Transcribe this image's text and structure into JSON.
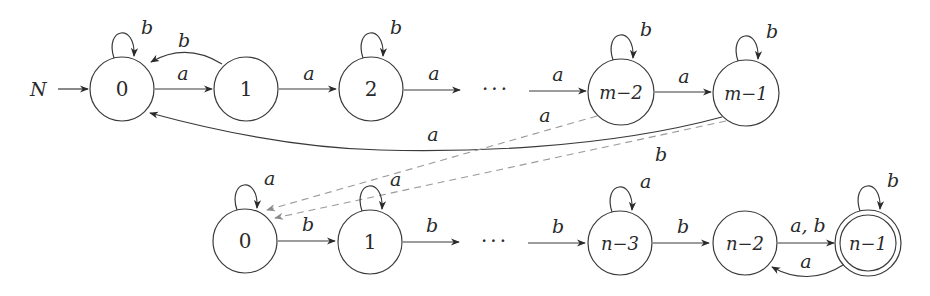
{
  "diagram": {
    "type": "finite-automaton",
    "start_label": "N",
    "ellipsis": "···",
    "top_row": {
      "states": [
        {
          "id": "t0",
          "label": "0",
          "self_loop": "b"
        },
        {
          "id": "t1",
          "label": "1"
        },
        {
          "id": "t2",
          "label": "2",
          "self_loop": "b"
        },
        {
          "id": "tm2",
          "label": "m−2",
          "self_loop": "b"
        },
        {
          "id": "tm1",
          "label": "m−1",
          "self_loop": "b"
        }
      ],
      "edges": [
        {
          "from": "t0",
          "to": "t1",
          "label": "a"
        },
        {
          "from": "t1",
          "to": "t0",
          "label": "b"
        },
        {
          "from": "t1",
          "to": "t2",
          "label": "a"
        },
        {
          "from": "t2",
          "to": "…",
          "label": "a"
        },
        {
          "from": "…",
          "to": "tm2",
          "label": "a"
        },
        {
          "from": "tm2",
          "to": "tm1",
          "label": "a"
        },
        {
          "from": "tm1",
          "to": "t0",
          "label": "a"
        }
      ]
    },
    "cross_edges": [
      {
        "from": "tm2",
        "to": "b0",
        "label": "a",
        "style": "dashed"
      },
      {
        "from": "tm1",
        "to": "b0",
        "label": "b",
        "style": "dashed"
      }
    ],
    "bottom_row": {
      "states": [
        {
          "id": "b0",
          "label": "0",
          "self_loop": "a"
        },
        {
          "id": "b1",
          "label": "1",
          "self_loop": "a"
        },
        {
          "id": "bn3",
          "label": "n−3",
          "self_loop": "a"
        },
        {
          "id": "bn2",
          "label": "n−2"
        },
        {
          "id": "bn1",
          "label": "n−1",
          "self_loop": "b",
          "accepting": true
        }
      ],
      "edges": [
        {
          "from": "b0",
          "to": "b1",
          "label": "b"
        },
        {
          "from": "b1",
          "to": "…",
          "label": "b"
        },
        {
          "from": "…",
          "to": "bn3",
          "label": "b"
        },
        {
          "from": "bn3",
          "to": "bn2",
          "label": "b"
        },
        {
          "from": "bn2",
          "to": "bn1",
          "label": "a, b"
        },
        {
          "from": "bn1",
          "to": "bn2",
          "label": "a"
        }
      ]
    }
  }
}
